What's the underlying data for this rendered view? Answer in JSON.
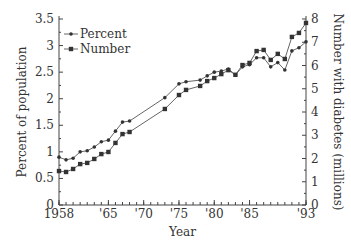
{
  "chart_data": {
    "type": "line",
    "title": "",
    "xlabel": "Year",
    "ylabel": "Percent of population",
    "y2label": "Number with diabetes (millions)",
    "xlim": [
      1958,
      1993
    ],
    "ylim": [
      0,
      3.5
    ],
    "y2lim": [
      0,
      8
    ],
    "x_ticks": [
      {
        "value": 1958,
        "label": "1958"
      },
      {
        "value": 1965,
        "label": "'65"
      },
      {
        "value": 1970,
        "label": "'70"
      },
      {
        "value": 1975,
        "label": "'75"
      },
      {
        "value": 1980,
        "label": "'80"
      },
      {
        "value": 1985,
        "label": "'85"
      },
      {
        "value": 1993,
        "label": "'93"
      }
    ],
    "y_ticks": [
      "0",
      "0.5",
      "1",
      "1.5",
      "2",
      "2.5",
      "3",
      "3.5"
    ],
    "y2_ticks": [
      "0",
      "1",
      "2",
      "3",
      "4",
      "5",
      "6",
      "7",
      "8"
    ],
    "legend_position": "upper-left",
    "grid": false,
    "series": [
      {
        "name": "Percent",
        "axis": "left",
        "marker": "circle",
        "x": [
          1958,
          1959,
          1960,
          1961,
          1962,
          1963,
          1964,
          1965,
          1966,
          1967,
          1968,
          1973,
          1975,
          1976,
          1978,
          1979,
          1980,
          1981,
          1982,
          1983,
          1984,
          1985,
          1986,
          1987,
          1988,
          1989,
          1990,
          1991,
          1992,
          1993
        ],
        "values": [
          0.9,
          0.85,
          0.88,
          1.0,
          1.02,
          1.09,
          1.19,
          1.22,
          1.39,
          1.56,
          1.58,
          2.02,
          2.28,
          2.32,
          2.35,
          2.43,
          2.5,
          2.52,
          2.56,
          2.45,
          2.6,
          2.64,
          2.77,
          2.77,
          2.6,
          2.68,
          2.54,
          2.9,
          2.96,
          3.07
        ]
      },
      {
        "name": "Number",
        "axis": "right",
        "marker": "square",
        "x": [
          1958,
          1959,
          1960,
          1961,
          1962,
          1963,
          1964,
          1965,
          1966,
          1967,
          1968,
          1973,
          1975,
          1976,
          1978,
          1979,
          1980,
          1981,
          1982,
          1983,
          1984,
          1985,
          1986,
          1987,
          1988,
          1989,
          1990,
          1991,
          1992,
          1993
        ],
        "values": [
          1.46,
          1.42,
          1.55,
          1.76,
          1.81,
          1.98,
          2.19,
          2.28,
          2.67,
          3.05,
          3.14,
          4.13,
          4.73,
          4.95,
          5.12,
          5.33,
          5.46,
          5.63,
          5.8,
          5.6,
          6.02,
          6.11,
          6.62,
          6.67,
          6.24,
          6.5,
          6.28,
          7.23,
          7.4,
          7.83
        ]
      }
    ]
  }
}
